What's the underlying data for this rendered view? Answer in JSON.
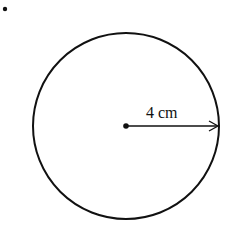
{
  "figure": {
    "number_fragment": ".",
    "shape": "circle",
    "radius_label": "4 cm",
    "center": [
      126,
      126
    ],
    "radius_px": 93,
    "stroke_color": "#111111"
  }
}
